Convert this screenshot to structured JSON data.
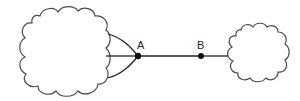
{
  "diagram": {
    "stroke_color": "#4a4a4a",
    "line_color": "#222222",
    "node_color": "#111111",
    "clouds": [
      {
        "id": "cloud-left",
        "cx": 65,
        "cy": 51,
        "rx": 45,
        "ry": 45
      },
      {
        "id": "cloud-right",
        "cx": 258,
        "cy": 52,
        "rx": 33,
        "ry": 29
      }
    ],
    "nodes": [
      {
        "id": "A",
        "label": "A",
        "x": 138,
        "y": 56
      },
      {
        "id": "B",
        "label": "B",
        "x": 201,
        "y": 56
      }
    ],
    "edges": [
      {
        "from": "cloud-left-top",
        "to": "A"
      },
      {
        "from": "cloud-left-mid",
        "to": "A"
      },
      {
        "from": "cloud-left-bottom",
        "to": "A"
      },
      {
        "from": "A",
        "to": "B"
      },
      {
        "from": "B",
        "to": "cloud-right"
      }
    ]
  }
}
